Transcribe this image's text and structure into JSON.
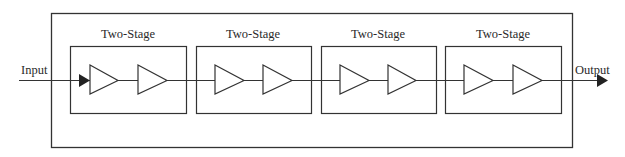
{
  "diagram": {
    "type": "block-diagram",
    "input_label": "Input",
    "output_label": "Output",
    "line_color": "#333333",
    "stages": [
      {
        "label": "Two-Stage",
        "amplifiers": 2
      },
      {
        "label": "Two-Stage",
        "amplifiers": 2
      },
      {
        "label": "Two-Stage",
        "amplifiers": 2
      },
      {
        "label": "Two-Stage",
        "amplifiers": 2
      }
    ]
  }
}
